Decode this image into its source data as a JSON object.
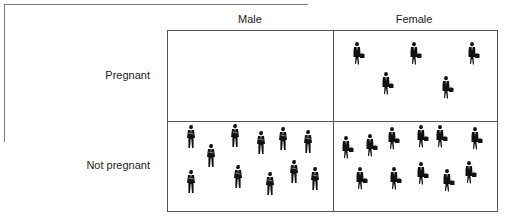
{
  "diagram": {
    "columns": [
      "Male",
      "Female"
    ],
    "rows": [
      "Pregnant",
      "Not pregnant"
    ],
    "cells": {
      "male_pregnant": {
        "count": 0
      },
      "female_pregnant": {
        "count": 5
      },
      "male_not_pregnant": {
        "count": 11
      },
      "female_not_pregnant": {
        "count": 11
      }
    },
    "icons": {
      "male": "businessman-silhouette-icon",
      "female": "businesswoman-with-bag-silhouette-icon"
    },
    "colors": {
      "figure": "#111111",
      "grid_line": "#555555",
      "frame_line": "#7a7a7a"
    }
  }
}
